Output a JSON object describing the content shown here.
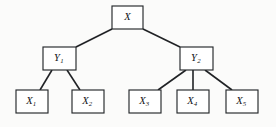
{
  "diagram": {
    "type": "tree",
    "background_color": "#fbfbfa",
    "node_fill": "#ffffff",
    "node_stroke": "#25282b",
    "edge_color": "#202225",
    "nodes": [
      {
        "id": "X",
        "base": "X",
        "subscript": "",
        "x": 112,
        "y": 6,
        "w": 31,
        "h": 23,
        "level": 0
      },
      {
        "id": "Y1",
        "base": "Y",
        "subscript": "1",
        "x": 43,
        "y": 47,
        "w": 33,
        "h": 23,
        "level": 1
      },
      {
        "id": "Y2",
        "base": "Y",
        "subscript": "2",
        "x": 180,
        "y": 47,
        "w": 33,
        "h": 23,
        "level": 1
      },
      {
        "id": "X1",
        "base": "X",
        "subscript": "1",
        "x": 16,
        "y": 90,
        "w": 32,
        "h": 23,
        "level": 2
      },
      {
        "id": "X2",
        "base": "X",
        "subscript": "2",
        "x": 72,
        "y": 90,
        "w": 32,
        "h": 23,
        "level": 2
      },
      {
        "id": "X3",
        "base": "X",
        "subscript": "3",
        "x": 129,
        "y": 90,
        "w": 32,
        "h": 23,
        "level": 2
      },
      {
        "id": "X4",
        "base": "X",
        "subscript": "4",
        "x": 177,
        "y": 90,
        "w": 32,
        "h": 23,
        "level": 2
      },
      {
        "id": "X5",
        "base": "X",
        "subscript": "5",
        "x": 226,
        "y": 90,
        "w": 32,
        "h": 23,
        "level": 2
      }
    ],
    "edges": [
      {
        "id": "X-Y1",
        "from": "X",
        "to": "Y1",
        "x1": 112,
        "y1": 29,
        "x2": 76,
        "y2": 47
      },
      {
        "id": "X-Y2",
        "from": "X",
        "to": "Y2",
        "x1": 143,
        "y1": 29,
        "x2": 180,
        "y2": 47
      },
      {
        "id": "Y1-X1",
        "from": "Y1",
        "to": "X1",
        "x1": 52,
        "y1": 70,
        "x2": 40,
        "y2": 90
      },
      {
        "id": "Y1-X2",
        "from": "Y1",
        "to": "X2",
        "x1": 67,
        "y1": 70,
        "x2": 80,
        "y2": 90
      },
      {
        "id": "Y2-X3",
        "from": "Y2",
        "to": "X3",
        "x1": 186,
        "y1": 70,
        "x2": 158,
        "y2": 90
      },
      {
        "id": "Y2-X4",
        "from": "Y2",
        "to": "X4",
        "x1": 193,
        "y1": 70,
        "x2": 193,
        "y2": 90
      },
      {
        "id": "Y2-X5",
        "from": "Y2",
        "to": "X5",
        "x1": 205,
        "y1": 70,
        "x2": 232,
        "y2": 90
      }
    ]
  }
}
